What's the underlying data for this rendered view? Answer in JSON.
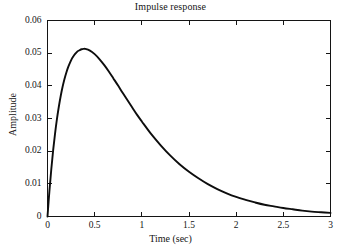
{
  "chart_data": {
    "type": "line",
    "title": "Impulse response",
    "xlabel": "Time (sec)",
    "ylabel": "Amplitude",
    "xlim": [
      0,
      3
    ],
    "ylim": [
      0,
      0.06
    ],
    "grid": false,
    "legend": null,
    "xticks": [
      0,
      0.5,
      1,
      1.5,
      2,
      2.5,
      3
    ],
    "xticklabels": [
      "0",
      "0.5",
      "1",
      "1.5",
      "2",
      "2.5",
      "3"
    ],
    "yticks": [
      0,
      0.01,
      0.02,
      0.03,
      0.04,
      0.05,
      0.06
    ],
    "yticklabels": [
      "0",
      "0.01",
      "0.02",
      "0.03",
      "0.04",
      "0.05",
      "0.06"
    ],
    "peak": {
      "x": 0.3,
      "y": 0.0543
    },
    "series": [
      {
        "name": "impulse response",
        "color": "#0d0d0d",
        "x": [
          0,
          0.02,
          0.04,
          0.06,
          0.08,
          0.1,
          0.12,
          0.14,
          0.16,
          0.18,
          0.2,
          0.22,
          0.24,
          0.26,
          0.28,
          0.3,
          0.32,
          0.34,
          0.36,
          0.38,
          0.4,
          0.45,
          0.5,
          0.55,
          0.6,
          0.65,
          0.7,
          0.75,
          0.8,
          0.85,
          0.9,
          0.95,
          1.0,
          1.1,
          1.2,
          1.3,
          1.4,
          1.5,
          1.6,
          1.7,
          1.8,
          1.9,
          2.0,
          2.1,
          2.2,
          2.3,
          2.4,
          2.5,
          2.6,
          2.7,
          2.8,
          2.9,
          3.0
        ],
        "y": [
          0,
          0.0077,
          0.0144,
          0.0203,
          0.0254,
          0.0298,
          0.0336,
          0.0369,
          0.0397,
          0.0421,
          0.0441,
          0.0458,
          0.0472,
          0.0484,
          0.0493,
          0.05,
          0.0506,
          0.0509,
          0.0512,
          0.0513,
          0.0513,
          0.0508,
          0.0497,
          0.0482,
          0.0464,
          0.0444,
          0.0422,
          0.04,
          0.0377,
          0.0355,
          0.0333,
          0.0311,
          0.0291,
          0.0252,
          0.0218,
          0.0187,
          0.016,
          0.0137,
          0.0117,
          0.0099,
          0.0084,
          0.0071,
          0.006,
          0.0051,
          0.0043,
          0.0036,
          0.0031,
          0.0026,
          0.0022,
          0.0018,
          0.0015,
          0.0013,
          0.0011
        ]
      }
    ]
  },
  "axes": {
    "title": "Impulse response",
    "xlabel": "Time (sec)",
    "ylabel": "Amplitude"
  }
}
